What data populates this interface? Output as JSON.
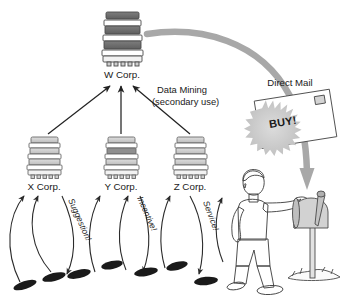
{
  "diagram": {
    "nodes": {
      "top_corp": {
        "label": "W Corp.",
        "icon": "office-building-icon"
      },
      "corp_x": {
        "label": "X Corp.",
        "icon": "office-building-icon"
      },
      "corp_y": {
        "label": "Y Corp.",
        "icon": "office-building-icon"
      },
      "corp_z": {
        "label": "Z Corp.",
        "icon": "office-building-icon"
      }
    },
    "annotations": {
      "data_mining_line1": "Data Mining",
      "data_mining_line2": "(secondary use)",
      "direct_mail": "Direct Mail",
      "mail_offer": "BUY!"
    },
    "exchange_labels": [
      {
        "text": "Suggestion!"
      },
      {
        "text": "Incentive!"
      },
      {
        "text": "Service!"
      }
    ],
    "objects": {
      "person": "walking-person-icon",
      "mailbox": "mailbox-icon",
      "postcard": "postcard-icon",
      "footprints": "shoe-icon"
    },
    "colors": {
      "building_dark": "#6e6e6e",
      "building_light": "#c9c9c9",
      "flow_arrow": "#a8a8a8",
      "ink": "#1a1a1a",
      "person_skin": "#d9d9d9",
      "person_shirt": "#e8e8e8",
      "person_shorts": "#8e8e8e",
      "starburst": "#d0d0d0"
    }
  }
}
